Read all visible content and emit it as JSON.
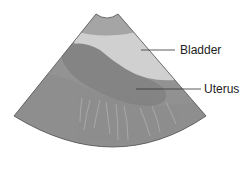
{
  "diagram": {
    "type": "ultrasound-sector-illustration",
    "labels": [
      {
        "id": "bladder",
        "text": "Bladder"
      },
      {
        "id": "uterus",
        "text": "Uterus"
      }
    ],
    "colors": {
      "sector_background": "#8f8f8f",
      "near_field": "#a9a9a9",
      "bladder": "#d2d2d2",
      "uterus": "#878787",
      "leader_line": "#333333",
      "text": "#222222"
    }
  }
}
